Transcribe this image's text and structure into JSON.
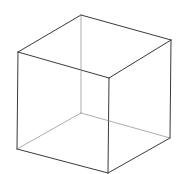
{
  "diagram": {
    "type": "wireframe-cube",
    "stroke_color": "#3a3a3a",
    "hidden_stroke_color": "#8a8a8a",
    "vertices": {
      "top_back": [
        81,
        15
      ],
      "top_left": [
        18,
        52
      ],
      "top_right": [
        171,
        40
      ],
      "top_front": [
        109,
        78
      ],
      "bottom_back": [
        81,
        113
      ],
      "bottom_left": [
        17,
        149
      ],
      "bottom_right": [
        170,
        138
      ],
      "bottom_front": [
        108,
        173
      ]
    }
  }
}
